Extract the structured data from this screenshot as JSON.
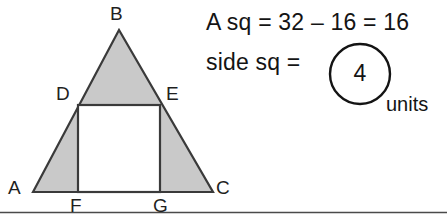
{
  "figure": {
    "type": "geometry-diagram",
    "shaded_fill": "#c9c9c9",
    "stroke": "#3a3a3a",
    "baseline_rule_color": "#4a4a4a",
    "vertex_labels": {
      "B": "B",
      "D": "D",
      "E": "E",
      "A": "A",
      "C": "C",
      "F": "F",
      "G": "G"
    },
    "points": {
      "A": [
        33,
        192
      ],
      "B": [
        119,
        30
      ],
      "C": [
        213,
        192
      ],
      "D": [
        78,
        105
      ],
      "E": [
        160,
        105
      ],
      "F": [
        78,
        192
      ],
      "G": [
        160,
        192
      ]
    }
  },
  "work": {
    "line1": "A sq = 32 – 16 = 16",
    "line2": "side sq =",
    "circled_value": "4",
    "units": "units"
  }
}
